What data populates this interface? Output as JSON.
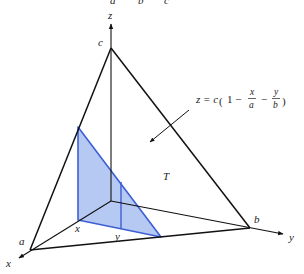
{
  "top_cut_labels": [
    "a",
    "b",
    "c"
  ],
  "axes": {
    "x_label": "x",
    "y_label": "y",
    "z_label": "z"
  },
  "points": {
    "a": "a",
    "b": "b",
    "c": "c"
  },
  "region_label": "T",
  "slice_labels": {
    "x": "x",
    "y": "y"
  },
  "formula": {
    "lhs": "z = c",
    "one": "1 −",
    "frac1_num": "x",
    "frac1_den": "a",
    "minus": "−",
    "frac2_num": "y",
    "frac2_den": "b"
  },
  "colors": {
    "edge": "#111111",
    "slice_fill": "#a9bff0",
    "slice_stroke": "#3d5fd4"
  }
}
